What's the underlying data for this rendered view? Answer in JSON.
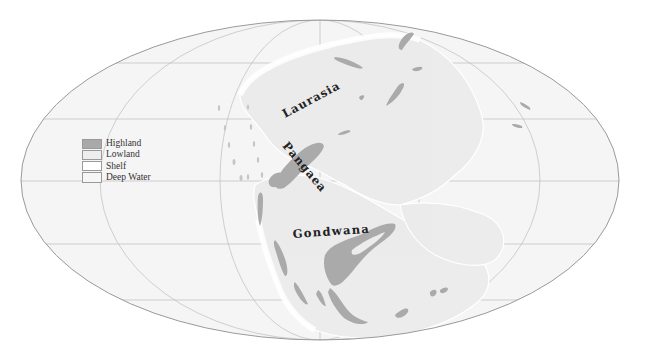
{
  "map": {
    "projection": "Mollweide",
    "colors": {
      "background": "#ffffff",
      "ocean": "#f5f5f5",
      "lowland": "#ececec",
      "shelf": "#ffffff",
      "highland": "#aaaaaa",
      "graticule": "#b5b5b5",
      "border": "#8a8a8a",
      "label": "#222222"
    },
    "labels": {
      "laurasia": "Laurasia",
      "pangaea": "Pangaea",
      "gondwana": "Gondwana"
    }
  },
  "legend": {
    "items": [
      {
        "label": "Highland",
        "color": "#a9a9a9"
      },
      {
        "label": "Lowland",
        "color": "#eeeeee"
      },
      {
        "label": "Shelf",
        "color": "#ffffff"
      },
      {
        "label": "Deep Water",
        "color": "#f6f6f6"
      }
    ]
  }
}
